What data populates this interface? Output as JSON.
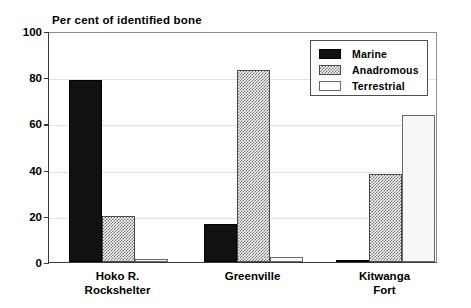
{
  "chart_data": {
    "type": "bar",
    "title": "Per cent of identified bone",
    "xlabel": "",
    "ylabel": "",
    "ylim": [
      0,
      100
    ],
    "yticks": [
      0,
      20,
      40,
      60,
      80,
      100
    ],
    "grid": true,
    "legend_position": "top-right",
    "categories": [
      "Hoko R.\nRockshelter",
      "Greenville",
      "Kitwanga\nFort"
    ],
    "category_lines": [
      [
        "Hoko R.",
        "Rockshelter"
      ],
      [
        "Greenville"
      ],
      [
        "Kitwanga",
        "Fort"
      ]
    ],
    "series": [
      {
        "name": "Marine",
        "values": [
          79,
          16.5,
          0.5
        ],
        "fill": "solid-black"
      },
      {
        "name": "Anadromous",
        "values": [
          19.8,
          83,
          38
        ],
        "fill": "cross-hatch"
      },
      {
        "name": "Terrestrial",
        "values": [
          1.5,
          2,
          63.5
        ],
        "fill": "white"
      }
    ]
  },
  "legend": {
    "items": [
      {
        "label": "Marine",
        "swatch": "solid-black"
      },
      {
        "label": "Anadromous",
        "swatch": "cross-hatch"
      },
      {
        "label": "Terrestrial",
        "swatch": "white"
      }
    ]
  },
  "axis": {
    "y_tick_labels": [
      "100",
      "80",
      "60",
      "40",
      "20",
      "0"
    ]
  },
  "colors": {
    "marine": "#111111",
    "anadromous_hatch": "#6f6f6f",
    "terrestrial": "#f7f7f7",
    "axis": "#3a3a3a",
    "grid": "#e2e2e2",
    "background": "#ffffff"
  }
}
